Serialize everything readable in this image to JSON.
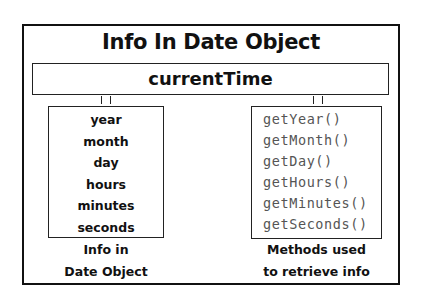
{
  "diagram": {
    "title": "Info In Date Object",
    "object_name": "currentTime",
    "info_fields": [
      "year",
      "month",
      "day",
      "hours",
      "minutes",
      "seconds"
    ],
    "methods": [
      "getYear()",
      "getMonth()",
      "getDay()",
      "getHours()",
      "getMinutes()",
      "getSeconds()"
    ],
    "left_caption": [
      "Info in",
      "Date Object"
    ],
    "right_caption": [
      "Methods used",
      "to retrieve info"
    ]
  }
}
